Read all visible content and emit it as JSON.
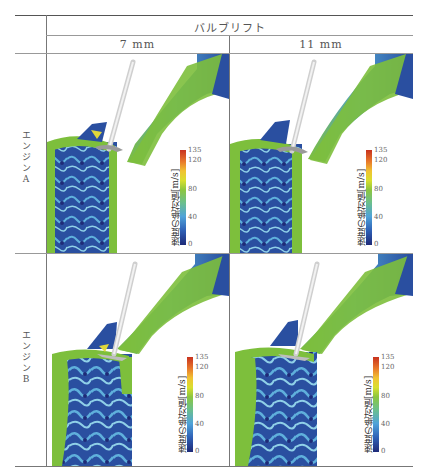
{
  "table": {
    "column_group_header": "バルブリフト",
    "columns": [
      "7 mm",
      "11 mm"
    ],
    "rows": [
      {
        "label": "エンジンA"
      },
      {
        "label": "エンジンB"
      }
    ]
  },
  "colorbar": {
    "title": "速度の絶対値[m/s]",
    "ticks": [
      "135",
      "120",
      "80",
      "40",
      "0"
    ]
  },
  "colors": {
    "port_green": "#7dbf3c",
    "cylinder_blue": "#2a4fa0",
    "light_blue": "#5fb0dc",
    "valve_gray": "#d8d8d8",
    "inlet_blue": "#3a62ad"
  }
}
